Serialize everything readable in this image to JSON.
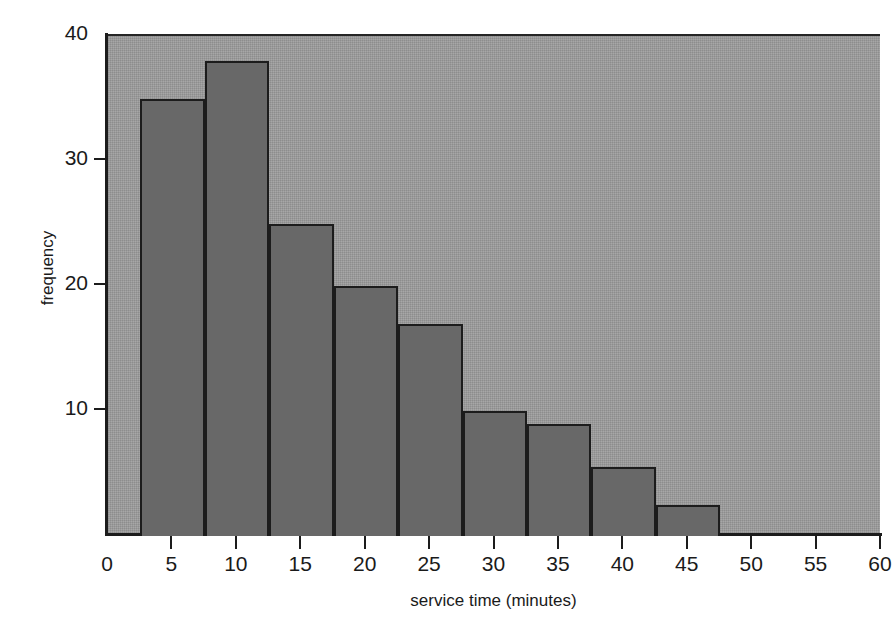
{
  "figure": {
    "top_cut_caption": "",
    "background_color": "#ffffff",
    "plot_background_color": "#9d9d9d",
    "bar_fill_color": "#686868",
    "bar_border_color": "#1c1c1c",
    "axis_color": "#1c1c1c"
  },
  "axes": {
    "y_title": "frequency",
    "x_title": "service time (minutes)",
    "y_ticks": [
      {
        "value": 10,
        "label": "10"
      },
      {
        "value": 20,
        "label": "20"
      },
      {
        "value": 30,
        "label": "30"
      },
      {
        "value": 40,
        "label": "40"
      }
    ],
    "x_ticks": [
      {
        "value": 0,
        "label": "0"
      },
      {
        "value": 5,
        "label": "5"
      },
      {
        "value": 10,
        "label": "10"
      },
      {
        "value": 15,
        "label": "15"
      },
      {
        "value": 20,
        "label": "20"
      },
      {
        "value": 25,
        "label": "25"
      },
      {
        "value": 30,
        "label": "30"
      },
      {
        "value": 35,
        "label": "35"
      },
      {
        "value": 40,
        "label": "40"
      },
      {
        "value": 45,
        "label": "45"
      },
      {
        "value": 50,
        "label": "50"
      },
      {
        "value": 55,
        "label": "55"
      },
      {
        "value": 60,
        "label": "60"
      }
    ]
  },
  "chart_data": {
    "type": "bar",
    "title": "",
    "xlabel": "service time (minutes)",
    "ylabel": "frequency",
    "xlim": [
      0,
      60
    ],
    "ylim": [
      0,
      40
    ],
    "grid": false,
    "legend": false,
    "bin_width": 5,
    "bin_start": 2.6,
    "categories": [
      "2.6-7.6",
      "7.6-12.6",
      "12.6-17.6",
      "17.6-22.6",
      "22.6-27.6",
      "27.6-32.6",
      "32.6-37.6",
      "37.6-42.6",
      "42.6-47.6"
    ],
    "bin_edges": [
      2.6,
      7.6,
      12.6,
      17.6,
      22.6,
      27.6,
      32.6,
      37.6,
      42.6,
      47.6
    ],
    "values": [
      35,
      38,
      25,
      20,
      17,
      10,
      9,
      5.5,
      2.5
    ],
    "bars": [
      {
        "bin_start": 2.6,
        "bin_end": 7.6,
        "value": 35
      },
      {
        "bin_start": 7.6,
        "bin_end": 12.6,
        "value": 38
      },
      {
        "bin_start": 12.6,
        "bin_end": 17.6,
        "value": 25
      },
      {
        "bin_start": 17.6,
        "bin_end": 22.6,
        "value": 20
      },
      {
        "bin_start": 22.6,
        "bin_end": 27.6,
        "value": 17
      },
      {
        "bin_start": 27.6,
        "bin_end": 32.6,
        "value": 10
      },
      {
        "bin_start": 32.6,
        "bin_end": 37.6,
        "value": 9
      },
      {
        "bin_start": 37.6,
        "bin_end": 42.6,
        "value": 5.5
      },
      {
        "bin_start": 42.6,
        "bin_end": 47.6,
        "value": 2.5
      }
    ]
  }
}
